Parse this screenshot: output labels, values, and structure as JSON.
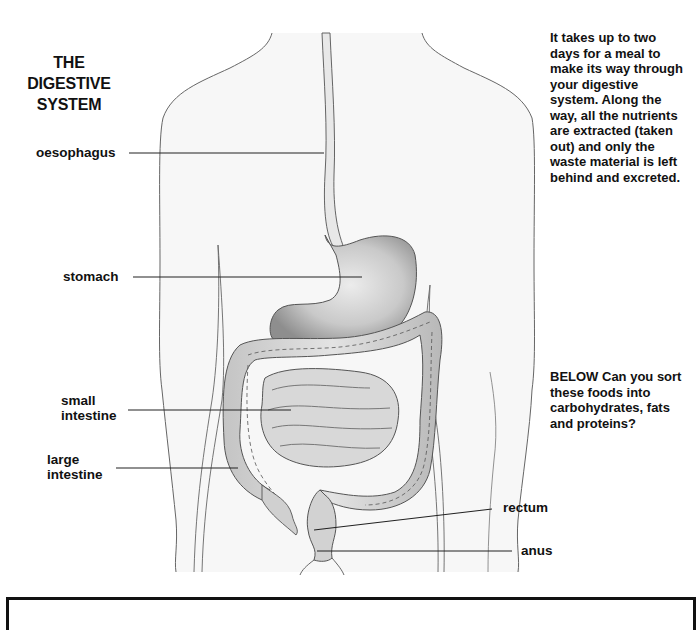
{
  "title": {
    "line1": "THE DIGESTIVE",
    "line2": "SYSTEM"
  },
  "labels": {
    "oesophagus": "oesophagus",
    "stomach": "stomach",
    "small_intestine_1": "small",
    "small_intestine_2": "intestine",
    "large_intestine_1": "large",
    "large_intestine_2": "intestine",
    "rectum": "rectum",
    "anus": "anus"
  },
  "intro_text": {
    "lines": [
      "It takes up to two",
      "days for a meal to",
      "make its way through",
      "your digestive",
      "system. Along the",
      "way, all the nutrients",
      "are extracted (taken",
      "out) and only the",
      "waste material is left",
      "behind and excreted."
    ]
  },
  "prompt_text": {
    "lines": [
      "BELOW Can you sort",
      "these foods into",
      "carbohydrates, fats",
      "and proteins?"
    ]
  },
  "colors": {
    "outline": "#555555",
    "leader_line": "#222222",
    "organ_fill": "#d4d4d4",
    "organ_dark": "#a9a9a9",
    "body_fill": "#f7f7f7",
    "box_border": "#111111"
  }
}
